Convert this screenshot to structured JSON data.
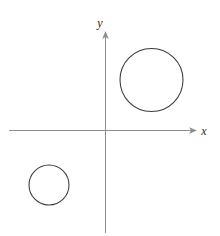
{
  "figure": {
    "background_color": "#ffffff",
    "width": 220,
    "height": 236
  },
  "axes": {
    "x_axis": {
      "label": "x",
      "label_x": 204,
      "label_y": 134,
      "line_y": 130,
      "line_x_start": 9,
      "line_x_end": 192,
      "arrow_tip_x": 197,
      "color": "#8d8d8d",
      "arrow": "right-arrow"
    },
    "y_axis": {
      "label": "y",
      "label_x": 100,
      "label_y": 27,
      "line_x": 105,
      "line_y_start": 36,
      "line_y_end": 233,
      "arrow_tip_y": 31,
      "color": "#8d8d8d",
      "arrow": "up-arrow"
    },
    "origin": {
      "x": 105,
      "y": 130
    }
  },
  "shapes": [
    {
      "name": "large-circle",
      "quadrant": "I",
      "center_x": 151.5,
      "center_y": 80,
      "radius": 31.5,
      "stroke_color": "#3b3b3b",
      "fill_color": "#ffffff"
    },
    {
      "name": "small-circle",
      "quadrant": "III",
      "center_x": 49,
      "center_y": 185,
      "radius": 20,
      "stroke_color": "#3b3b3b",
      "fill_color": "#ffffff"
    }
  ],
  "chart_data": {
    "type": "scatter",
    "title": "",
    "xlabel": "x",
    "ylabel": "y",
    "grid": false,
    "legend": "none",
    "axis_style": "arrow-ended cartesian axes through origin",
    "annotations": [
      {
        "kind": "circle",
        "label": "large circle in first quadrant",
        "center": [
          1.48,
          1.59
        ],
        "radius_px": 31.5,
        "center_px": [
          151.5,
          80
        ]
      },
      {
        "kind": "circle",
        "label": "small circle in third quadrant",
        "center": [
          -1.78,
          -0.94
        ],
        "radius_px": 20,
        "center_px": [
          49,
          185
        ]
      }
    ],
    "x": [
      1.48,
      -1.78
    ],
    "y": [
      1.59,
      -0.94
    ],
    "series": [
      {
        "name": "circles",
        "values": [
          {
            "cx": 1.48,
            "cy": 1.59,
            "r": 0.9
          },
          {
            "cx": -1.78,
            "cy": -0.94,
            "r": 0.57
          }
        ]
      }
    ]
  }
}
